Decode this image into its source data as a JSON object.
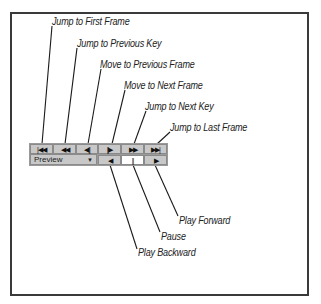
{
  "diagram": {
    "title_labels": {
      "jump_first": "Jump to First Frame",
      "jump_prev_key": "Jump to Previous Key",
      "move_prev": "Move to Previous Frame",
      "move_next": "Move to Next Frame",
      "jump_next_key": "Jump to Next Key",
      "jump_last": "Jump to Last Frame",
      "play_forward": "Play Forward",
      "pause": "Pause",
      "play_backward": "Play Backward"
    },
    "buttons_row1": [
      {
        "name": "jump-first",
        "glyph": "|◀◀"
      },
      {
        "name": "jump-prev-key",
        "glyph": "◀◀"
      },
      {
        "name": "move-prev",
        "glyph": "◀||"
      },
      {
        "name": "move-next",
        "glyph": "||▶"
      },
      {
        "name": "jump-next-key",
        "glyph": "▶▶"
      },
      {
        "name": "jump-last",
        "glyph": "▶▶|"
      }
    ],
    "buttons_row2": [
      {
        "name": "play-backward",
        "glyph": "◀"
      },
      {
        "name": "pause",
        "glyph": "||"
      },
      {
        "name": "play-forward",
        "glyph": "▶"
      }
    ],
    "dropdown": {
      "value": "Preview",
      "caret": "▼"
    }
  }
}
